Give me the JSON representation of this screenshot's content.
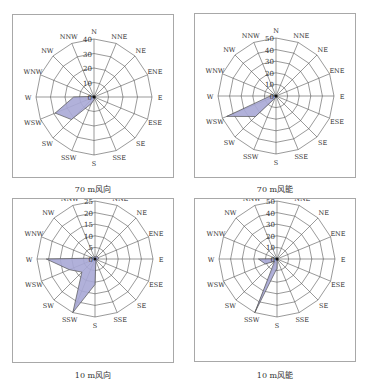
{
  "chart_data": [
    {
      "type": "radar",
      "title": "70 m风向",
      "directions": [
        "N",
        "NNE",
        "NE",
        "ENE",
        "E",
        "ESE",
        "SE",
        "SSE",
        "S",
        "SSW",
        "SW",
        "WSW",
        "W",
        "WNW",
        "NW",
        "NNW"
      ],
      "ring_ticks": [
        0,
        10,
        20,
        30,
        40
      ],
      "rmax": 40,
      "values": [
        1,
        1,
        1,
        1,
        1,
        1,
        1,
        1,
        2,
        5,
        22,
        29,
        14,
        1,
        1,
        1
      ],
      "fill": "#a9a9d6",
      "stroke": "#555555"
    },
    {
      "type": "radar",
      "title": "70 m风能",
      "directions": [
        "N",
        "NNE",
        "NE",
        "ENE",
        "E",
        "ESE",
        "SE",
        "SSE",
        "S",
        "SSW",
        "SW",
        "WSW",
        "W",
        "WNW",
        "NW",
        "NNW"
      ],
      "ring_ticks": [
        0,
        10,
        20,
        30,
        40,
        50
      ],
      "rmax": 50,
      "values": [
        0.5,
        0.5,
        0.5,
        0.5,
        0.5,
        0.5,
        0.5,
        0.5,
        1,
        2,
        25,
        46,
        5,
        0.5,
        0.5,
        0.5
      ],
      "fill": "#a9a9d6",
      "stroke": "#555555"
    },
    {
      "type": "radar",
      "title": "10 m风向",
      "directions": [
        "N",
        "NNE",
        "NE",
        "ENE",
        "E",
        "ESE",
        "SE",
        "SSE",
        "S",
        "SSW",
        "SW",
        "WSW",
        "W",
        "WNW",
        "NW",
        "NNW"
      ],
      "ring_ticks": [
        0,
        5,
        10,
        15,
        20,
        25
      ],
      "rmax": 25,
      "values": [
        1,
        1,
        1.5,
        1.5,
        1.5,
        1,
        1,
        1,
        11,
        25,
        8,
        12,
        21,
        1,
        1,
        1
      ],
      "fill": "#a9a9d6",
      "stroke": "#555555"
    },
    {
      "type": "radar",
      "title": "10 m风能",
      "directions": [
        "N",
        "NNE",
        "NE",
        "ENE",
        "E",
        "ESE",
        "SE",
        "SSE",
        "S",
        "SSW",
        "SW",
        "WSW",
        "W",
        "WNW",
        "NW",
        "NNW"
      ],
      "ring_ticks": [
        0,
        10,
        20,
        30,
        40,
        50
      ],
      "rmax": 50,
      "values": [
        0.5,
        0.5,
        0.5,
        0.5,
        0.5,
        0.5,
        0.5,
        0.5,
        8,
        50,
        3,
        11,
        16,
        0.5,
        0.5,
        0.5
      ],
      "fill": "#a9a9d6",
      "stroke": "#555555"
    }
  ],
  "captions": [
    "70 m风向",
    "70 m风能",
    "10 m风向",
    "10 m风能"
  ]
}
